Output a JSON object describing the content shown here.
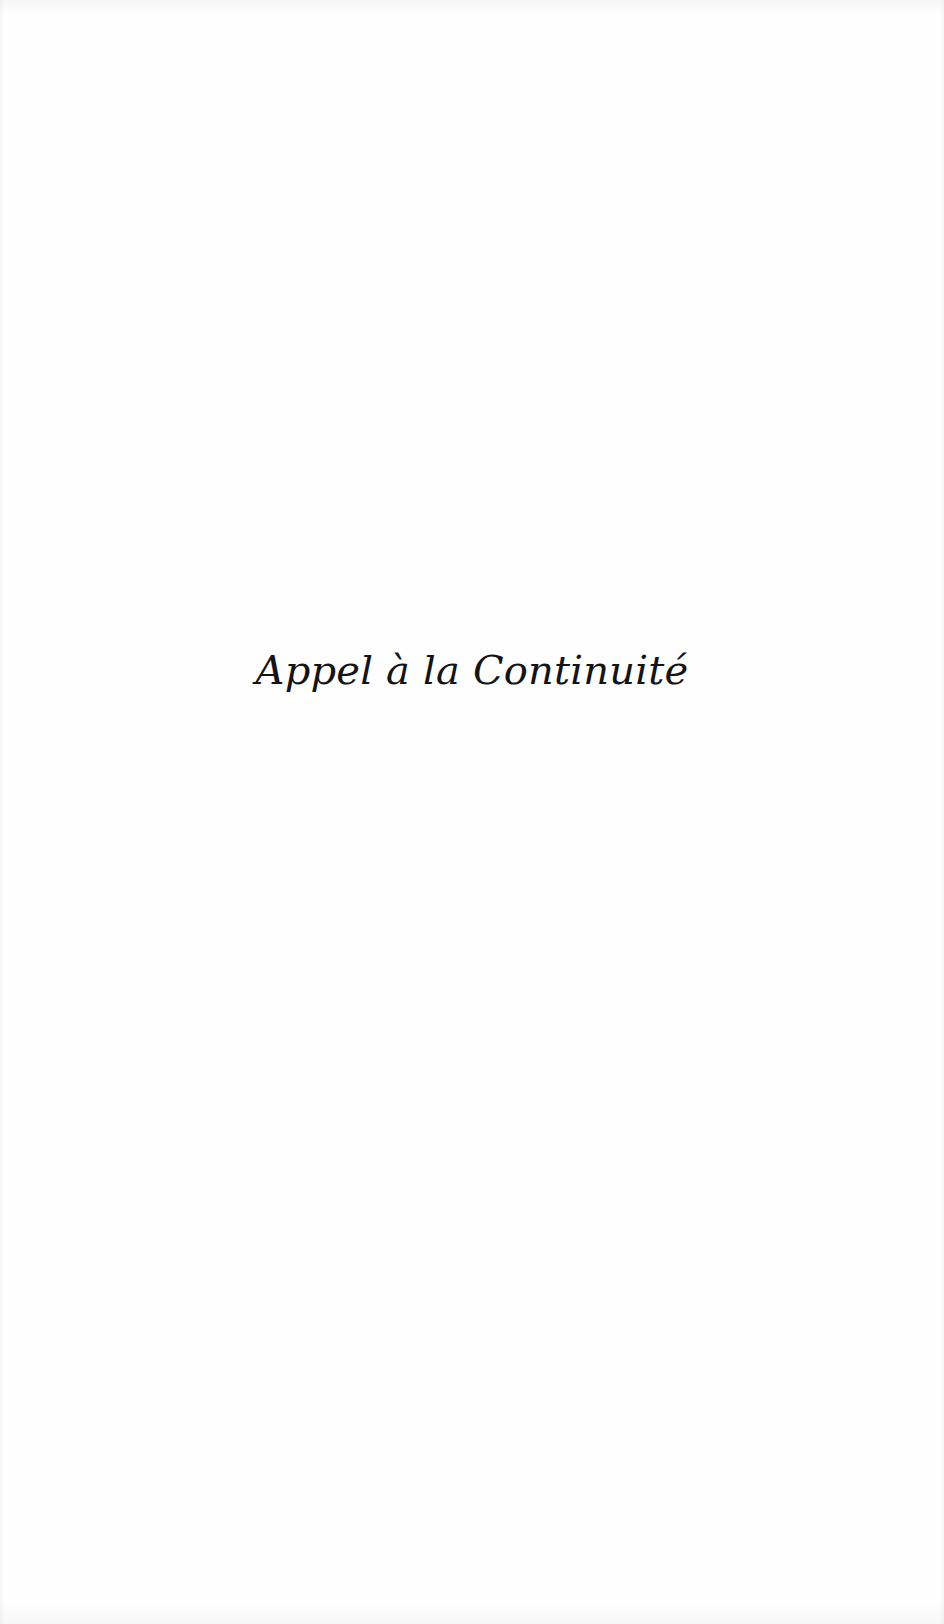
{
  "page": {
    "type": "half-title",
    "background_color": "#fefefe",
    "text_color": "#141414"
  },
  "half_title": {
    "text": "Appel à la Continuité"
  }
}
